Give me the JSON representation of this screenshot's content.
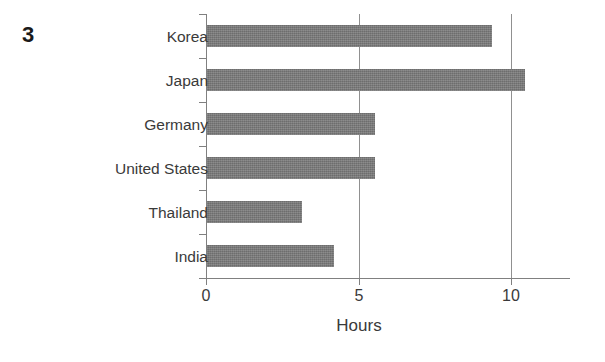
{
  "figure": {
    "number": "3"
  },
  "chart_data": {
    "type": "bar",
    "orientation": "horizontal",
    "title": "",
    "subtitle": "",
    "xlabel": "Hours",
    "ylabel": "",
    "categories": [
      "Korea",
      "Japan",
      "Germany",
      "United States",
      "Thailand",
      "India"
    ],
    "values": [
      9.3,
      10.4,
      5.5,
      5.5,
      3.1,
      4.15
    ],
    "series": [
      {
        "name": "Hours",
        "values": [
          9.3,
          10.4,
          5.5,
          5.5,
          3.1,
          4.15
        ]
      }
    ],
    "xticks": [
      0,
      5,
      10
    ],
    "xtick_labels": [
      "0",
      "5",
      "10"
    ],
    "xlim": [
      0,
      12
    ],
    "grid": "vertical",
    "legend": "none",
    "bar_color": "#757575",
    "axis_color": "#808080",
    "text_color": "#3a3a3a",
    "background": "#ffffff"
  }
}
